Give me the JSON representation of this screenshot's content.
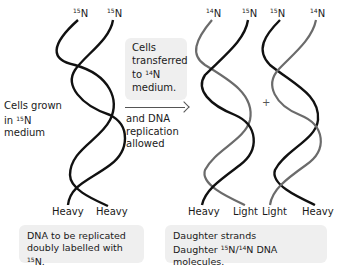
{
  "diagram": {
    "parent": {
      "top_labels": [
        {
          "prefix": "15",
          "element": "N"
        },
        {
          "prefix": "15",
          "element": "N"
        }
      ],
      "bottom_labels": [
        "Heavy",
        "Heavy"
      ],
      "side_text": {
        "line1": "Cells grown",
        "line2_pre": "in ",
        "line2_sup": "15",
        "line2_post": "N",
        "line3": "medium"
      }
    },
    "transfer_box": {
      "line1": "Cells",
      "line2": "transferred",
      "line3_pre": "to ",
      "line3_sup": "14",
      "line3_post": "N",
      "line4": "medium."
    },
    "arrow_text": {
      "line1": "and DNA",
      "line2": "replication",
      "line3": "allowed"
    },
    "daughter_1": {
      "top_labels": [
        {
          "prefix": "14",
          "element": "N"
        },
        {
          "prefix": "15",
          "element": "N"
        }
      ],
      "bottom_labels": [
        "Heavy",
        "Light"
      ]
    },
    "plus_sign": "+",
    "daughter_2": {
      "top_labels": [
        {
          "prefix": "15",
          "element": "N"
        },
        {
          "prefix": "14",
          "element": "N"
        }
      ],
      "bottom_labels": [
        "Light",
        "Heavy"
      ]
    },
    "captions": {
      "left": {
        "line1": "DNA to be replicated",
        "line2_pre": "doubly labelled with ",
        "line2_sup": "15",
        "line2_post": "N."
      },
      "right": {
        "line1": "Daughter strands",
        "line2_pre": "Daughter ",
        "line2_sup1": "15",
        "line2_mid": "N/",
        "line2_sup2": "14",
        "line2_post": "N DNA molecules."
      }
    },
    "colors": {
      "heavy_strand": "#111111",
      "light_strand": "#6b6b6b",
      "box_fill": "#efefef"
    }
  }
}
